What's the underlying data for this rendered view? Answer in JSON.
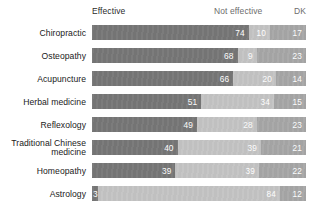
{
  "chart_data": {
    "type": "bar",
    "subtype": "stacked-horizontal-100",
    "title": "",
    "xlabel": "",
    "ylabel": "",
    "xlim": [
      0,
      101
    ],
    "grid": false,
    "legend_position": "top",
    "categories": [
      "Chiropractic",
      "Osteopathy",
      "Acupuncture",
      "Herbal medicine",
      "Reflexology",
      "Traditional Chinese\nmedicine",
      "Homeopathy",
      "Astrology"
    ],
    "series": [
      {
        "name": "Effective",
        "color": "#767676",
        "values": [
          74,
          68,
          66,
          51,
          49,
          40,
          39,
          3
        ]
      },
      {
        "name": "Not effective",
        "color": "#c3c3c3",
        "values": [
          10,
          9,
          20,
          34,
          28,
          39,
          39,
          84
        ]
      },
      {
        "name": "DK",
        "color": "#a6a6a6",
        "values": [
          17,
          23,
          14,
          15,
          23,
          21,
          22,
          12
        ]
      }
    ]
  },
  "header": {
    "effective": "Effective",
    "not_effective": "Not effective",
    "dk": "DK"
  },
  "rows": [
    {
      "label": "Chiropractic",
      "values": [
        74,
        10,
        17
      ]
    },
    {
      "label": "Osteopathy",
      "values": [
        68,
        9,
        23
      ]
    },
    {
      "label": "Acupuncture",
      "values": [
        66,
        20,
        14
      ]
    },
    {
      "label": "Herbal medicine",
      "values": [
        51,
        34,
        15
      ]
    },
    {
      "label": "Reflexology",
      "values": [
        49,
        28,
        23
      ]
    },
    {
      "label": "Traditional Chinese\nmedicine",
      "values": [
        40,
        39,
        21
      ]
    },
    {
      "label": "Homeopathy",
      "values": [
        39,
        39,
        22
      ]
    },
    {
      "label": "Astrology",
      "values": [
        3,
        84,
        12
      ]
    }
  ]
}
